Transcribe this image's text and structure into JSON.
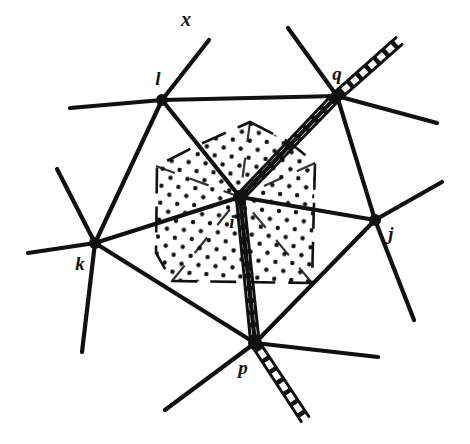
{
  "figure": {
    "kind": "lattice-dislocation-diagram",
    "background_color": "#ffffff",
    "ink_color": "#111111",
    "width": 470,
    "height": 444
  },
  "labels": {
    "axis_x": "x",
    "node_l": "l",
    "node_q": "q",
    "node_i": "i",
    "node_k": "k",
    "node_j": "j",
    "node_p": "p"
  },
  "nodes": [
    {
      "id": "l",
      "label": "l",
      "x": 162,
      "y": 100,
      "label_x": 158,
      "label_y": 85,
      "radius": 6
    },
    {
      "id": "q",
      "label": "q",
      "x": 337,
      "y": 96,
      "label_x": 337,
      "label_y": 80,
      "radius": 6
    },
    {
      "id": "i",
      "label": "i",
      "x": 240,
      "y": 197,
      "label_x": 232,
      "label_y": 228,
      "radius": 7
    },
    {
      "id": "k",
      "label": "k",
      "x": 95,
      "y": 243,
      "label_x": 80,
      "label_y": 270,
      "radius": 6
    },
    {
      "id": "j",
      "label": "j",
      "x": 375,
      "y": 220,
      "label_x": 391,
      "label_y": 240,
      "radius": 6
    },
    {
      "id": "p",
      "label": "p",
      "x": 255,
      "y": 343,
      "label_x": 243,
      "label_y": 374,
      "radius": 7
    }
  ],
  "axis_marker": {
    "label": "x",
    "x": 186,
    "y": 26
  },
  "bonds": [
    {
      "from": "l",
      "to": "q",
      "width": 4.2
    },
    {
      "from": "l",
      "to": "i",
      "width": 4.2
    },
    {
      "from": "l",
      "to": "k",
      "width": 4.2
    },
    {
      "from": "q",
      "to": "i",
      "width": 4.2
    },
    {
      "from": "q",
      "to": "j",
      "width": 4.2
    },
    {
      "from": "i",
      "to": "k",
      "width": 4.2
    },
    {
      "from": "i",
      "to": "j",
      "width": 4.2
    },
    {
      "from": "i",
      "to": "p",
      "width": 4.2
    },
    {
      "from": "k",
      "to": "p",
      "width": 4.2
    },
    {
      "from": "p",
      "to": "j",
      "width": 4.2
    }
  ],
  "stubs": [
    {
      "from": "l",
      "x2": 209,
      "y2": 40,
      "width": 4.2,
      "name": "stub-l-x-axis"
    },
    {
      "from": "l",
      "x2": 70,
      "y2": 108,
      "width": 4.2,
      "name": "stub-l-west"
    },
    {
      "from": "q",
      "x2": 288,
      "y2": 28,
      "width": 4.2,
      "name": "stub-q-northwest"
    },
    {
      "from": "q",
      "x2": 437,
      "y2": 123,
      "width": 4.2,
      "name": "stub-q-east"
    },
    {
      "from": "k",
      "x2": 57,
      "y2": 169,
      "width": 4.2,
      "name": "stub-k-northwest"
    },
    {
      "from": "k",
      "x2": 28,
      "y2": 253,
      "width": 4.2,
      "name": "stub-k-west"
    },
    {
      "from": "k",
      "x2": 82,
      "y2": 352,
      "width": 4.2,
      "name": "stub-k-south"
    },
    {
      "from": "j",
      "x2": 442,
      "y2": 182,
      "width": 4.2,
      "name": "stub-j-northeast"
    },
    {
      "from": "j",
      "x2": 414,
      "y2": 320,
      "width": 4.2,
      "name": "stub-j-southeast"
    },
    {
      "from": "p",
      "x2": 165,
      "y2": 410,
      "width": 4.2,
      "name": "stub-p-southwest"
    },
    {
      "from": "p",
      "x2": 378,
      "y2": 357,
      "width": 4.2,
      "name": "stub-p-east"
    }
  ],
  "dislocation_line": {
    "name": "extra-half-plane-track",
    "description": "hatched double rail running from upper-right through q, i, p to lower-right",
    "points": [
      [
        399,
        41
      ],
      [
        337,
        96
      ],
      [
        240,
        197
      ],
      [
        255,
        343
      ],
      [
        305,
        419
      ]
    ],
    "rail_gap": 9,
    "tie_spacing": 13,
    "width": 3
  },
  "dotted_region": {
    "name": "strained-lattice-region",
    "dot_color": "#111111",
    "dot_radius": 2.2,
    "boundary_style": "dashed",
    "outline": [
      [
        250,
        122
      ],
      [
        289,
        142
      ],
      [
        315,
        163
      ],
      [
        312,
        283
      ],
      [
        172,
        281
      ],
      [
        156,
        253
      ],
      [
        157,
        166
      ],
      [
        196,
        146
      ]
    ],
    "inner_cuts": [
      [
        [
          156,
          166
        ],
        [
          240,
          197
        ]
      ],
      [
        [
          250,
          122
        ],
        [
          240,
          197
        ]
      ],
      [
        [
          315,
          163
        ],
        [
          240,
          197
        ]
      ],
      [
        [
          172,
          281
        ],
        [
          240,
          197
        ]
      ],
      [
        [
          312,
          283
        ],
        [
          240,
          197
        ]
      ]
    ]
  }
}
